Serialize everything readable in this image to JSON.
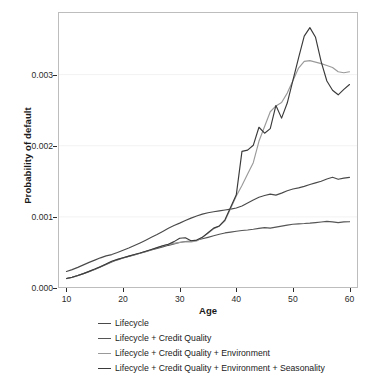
{
  "chart_data": {
    "type": "line",
    "title": "",
    "xlabel": "Age",
    "ylabel": "Probability of default",
    "xlim": [
      8.5,
      61.5
    ],
    "ylim": [
      0.0,
      0.00388
    ],
    "xticks": [
      10,
      20,
      30,
      40,
      50,
      60
    ],
    "yticks": [
      0.0,
      0.001,
      0.002,
      0.003
    ],
    "ytick_labels": [
      "0.000",
      "0.001",
      "0.002",
      "0.003"
    ],
    "xtick_labels": [
      "10",
      "20",
      "30",
      "40",
      "50",
      "60"
    ],
    "grid": true,
    "grid_axis": "y",
    "legend_position": "below",
    "x": [
      10,
      11,
      12,
      13,
      14,
      15,
      16,
      17,
      18,
      19,
      20,
      21,
      22,
      23,
      24,
      25,
      26,
      27,
      28,
      29,
      30,
      31,
      32,
      33,
      34,
      35,
      36,
      37,
      38,
      39,
      40,
      41,
      42,
      43,
      44,
      45,
      46,
      47,
      48,
      49,
      50,
      51,
      52,
      53,
      54,
      55,
      56,
      57,
      58,
      59,
      60
    ],
    "series": [
      {
        "name": "Lifecycle",
        "color": "#4a4a4a",
        "values": [
          0.000232,
          0.000258,
          0.00029,
          0.000325,
          0.00036,
          0.000392,
          0.000424,
          0.000452,
          0.00047,
          0.000498,
          0.00053,
          0.000562,
          0.000598,
          0.000634,
          0.000672,
          0.000712,
          0.000752,
          0.000796,
          0.00084,
          0.000878,
          0.000912,
          0.000948,
          0.000982,
          0.001012,
          0.001038,
          0.001058,
          0.001072,
          0.001084,
          0.001096,
          0.001108,
          0.001124,
          0.001152,
          0.001194,
          0.001238,
          0.001276,
          0.0013,
          0.00132,
          0.001306,
          0.001334,
          0.001368,
          0.001392,
          0.001408,
          0.001428,
          0.001454,
          0.001478,
          0.0015,
          0.001532,
          0.001556,
          0.001528,
          0.001544,
          0.001556
        ]
      },
      {
        "name": "Lifecycle + Credit Quality",
        "color": "#555555",
        "values": [
          0.000134,
          0.000152,
          0.000176,
          0.000204,
          0.000232,
          0.000262,
          0.000296,
          0.00033,
          0.000366,
          0.000396,
          0.000422,
          0.000444,
          0.000466,
          0.000488,
          0.000512,
          0.000534,
          0.000556,
          0.000578,
          0.0006,
          0.00062,
          0.00064,
          0.000654,
          0.00066,
          0.000672,
          0.000692,
          0.000712,
          0.000734,
          0.000756,
          0.000774,
          0.000786,
          0.000798,
          0.000808,
          0.000816,
          0.000826,
          0.000838,
          0.000848,
          0.000842,
          0.000856,
          0.00087,
          0.000884,
          0.000896,
          0.000902,
          0.000906,
          0.000912,
          0.00092,
          0.000928,
          0.000936,
          0.00093,
          0.00092,
          0.00093,
          0.000932
        ]
      },
      {
        "name": "Lifecycle + Credit Quality + Environment",
        "color": "#9a9a9a",
        "values": [
          0.000132,
          0.00015,
          0.000174,
          0.0002,
          0.00023,
          0.000264,
          0.000302,
          0.000338,
          0.000372,
          0.0004,
          0.000424,
          0.000446,
          0.000468,
          0.00049,
          0.000514,
          0.00054,
          0.000566,
          0.000592,
          0.000614,
          0.000628,
          0.000642,
          0.00065,
          0.000646,
          0.000662,
          0.000714,
          0.00077,
          0.000832,
          0.00087,
          0.000946,
          0.001118,
          0.001292,
          0.001442,
          0.001602,
          0.001762,
          0.002062,
          0.00227,
          0.002478,
          0.00256,
          0.002608,
          0.00274,
          0.002912,
          0.003092,
          0.003186,
          0.003196,
          0.003176,
          0.003154,
          0.003128,
          0.0031,
          0.00304,
          0.003026,
          0.00304
        ]
      },
      {
        "name": "Lifecycle + Credit Quality + Environment + Seasonality",
        "color": "#3a3a3a",
        "values": [
          0.000134,
          0.000152,
          0.000176,
          0.000202,
          0.000234,
          0.000266,
          0.0003,
          0.000336,
          0.000376,
          0.000402,
          0.000426,
          0.000448,
          0.00047,
          0.000492,
          0.000516,
          0.000542,
          0.000568,
          0.000594,
          0.000616,
          0.000652,
          0.0007,
          0.000706,
          0.000664,
          0.000674,
          0.000712,
          0.000776,
          0.000842,
          0.000872,
          0.000958,
          0.001136,
          0.00131,
          0.00192,
          0.001938,
          0.002006,
          0.00226,
          0.002176,
          0.00224,
          0.002566,
          0.002388,
          0.0026,
          0.00292,
          0.003236,
          0.00354,
          0.00366,
          0.003524,
          0.00318,
          0.00291,
          0.00278,
          0.002716,
          0.002792,
          0.00286
        ]
      }
    ]
  },
  "axes": {
    "xlabel": "Age",
    "ylabel": "Probability of default"
  },
  "legend": {
    "items": [
      {
        "label": "Lifecycle",
        "color": "#4a4a4a"
      },
      {
        "label": "Lifecycle + Credit Quality",
        "color": "#555555"
      },
      {
        "label": "Lifecycle + Credit Quality + Environment",
        "color": "#9a9a9a"
      },
      {
        "label": "Lifecycle + Credit Quality + Environment + Seasonality",
        "color": "#3a3a3a"
      }
    ]
  },
  "style": {
    "background": "#ffffff",
    "frame_color": "#bdbdbd",
    "grid_color": "#f2f2f2",
    "tick_color": "#2b2b2b"
  }
}
